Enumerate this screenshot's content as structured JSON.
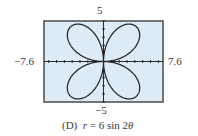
{
  "chart_data": {
    "type": "line",
    "subtype": "polar",
    "caption": {
      "letter": "(D)",
      "equation_var": "r",
      "equation_rest": "= 6 sin 2",
      "theta": "θ"
    },
    "equation": "r = 6 sin 2θ",
    "xlim": [
      -7.6,
      7.6
    ],
    "ylim": [
      -5,
      5
    ],
    "tick_labels": {
      "xmin": "−7.6",
      "xmax": "7.6",
      "ymin": "−5",
      "ymax": "5"
    },
    "x_ticks_step": 1,
    "y_ticks_step": 1,
    "series": [
      {
        "name": "r = 6 sin 2θ",
        "theta_range": [
          0,
          6.2832
        ],
        "amplitude": 6,
        "frequency": 2,
        "petals": 4,
        "sample_points": [
          {
            "theta_deg": 0,
            "x": 0,
            "y": 0
          },
          {
            "theta_deg": 45,
            "x": 4.24,
            "y": 4.24
          },
          {
            "theta_deg": 90,
            "x": 0,
            "y": 0
          },
          {
            "theta_deg": 135,
            "x": -4.24,
            "y": 4.24
          },
          {
            "theta_deg": 180,
            "x": 0,
            "y": 0
          },
          {
            "theta_deg": 225,
            "x": -4.24,
            "y": -4.24
          },
          {
            "theta_deg": 270,
            "x": 0,
            "y": 0
          },
          {
            "theta_deg": 315,
            "x": 4.24,
            "y": -4.24
          }
        ]
      }
    ],
    "grid": false,
    "legend": null,
    "colors": {
      "background": "#dcebf6",
      "frame": "#555555",
      "curve": "#2b2b2b",
      "axes": "#2b2b2b"
    }
  }
}
